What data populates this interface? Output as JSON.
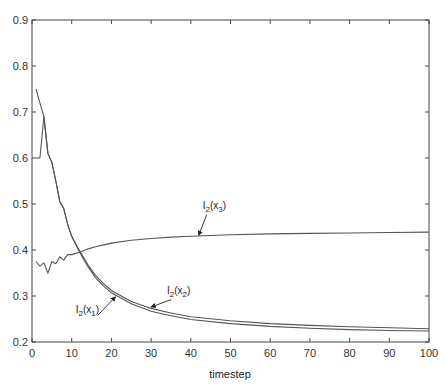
{
  "chart_data": {
    "type": "line",
    "title": "",
    "xlabel": "timestep",
    "ylabel": "",
    "xlim": [
      0,
      100
    ],
    "ylim": [
      0.2,
      0.9
    ],
    "xticks": [
      0,
      10,
      20,
      30,
      40,
      50,
      60,
      70,
      80,
      90,
      100
    ],
    "yticks": [
      0.2,
      0.3,
      0.4,
      0.5,
      0.6,
      0.7,
      0.8,
      0.9
    ],
    "ytick_labels": [
      "0.2",
      "0.3",
      "0.4",
      "0.5",
      "0.6",
      "0.7",
      "0.8",
      "0.9"
    ],
    "grid": false,
    "legend": "none",
    "line_color": "#555555",
    "series": [
      {
        "name": "I2(x1)",
        "label_base": "I",
        "label_sub1": "2",
        "label_mid": "(x",
        "label_sub2": "1",
        "label_end": ")",
        "x": [
          1,
          2,
          3,
          4,
          5,
          6,
          7,
          8,
          9,
          10,
          12,
          14,
          16,
          18,
          20,
          25,
          30,
          35,
          40,
          50,
          60,
          70,
          80,
          90,
          100
        ],
        "y": [
          0.75,
          0.72,
          0.69,
          0.61,
          0.59,
          0.55,
          0.505,
          0.49,
          0.455,
          0.43,
          0.395,
          0.365,
          0.34,
          0.322,
          0.307,
          0.283,
          0.267,
          0.257,
          0.249,
          0.24,
          0.234,
          0.23,
          0.227,
          0.225,
          0.224
        ]
      },
      {
        "name": "I2(x2)",
        "label_base": "I",
        "label_sub1": "2",
        "label_mid": "(x",
        "label_sub2": "2",
        "label_end": ")",
        "x": [
          1,
          2,
          3,
          4,
          5,
          6,
          7,
          8,
          9,
          10,
          12,
          14,
          16,
          18,
          20,
          25,
          30,
          35,
          40,
          50,
          60,
          70,
          80,
          90,
          100
        ],
        "y": [
          0.6,
          0.6,
          0.69,
          0.61,
          0.59,
          0.55,
          0.505,
          0.49,
          0.455,
          0.43,
          0.398,
          0.369,
          0.345,
          0.327,
          0.312,
          0.288,
          0.273,
          0.263,
          0.255,
          0.246,
          0.24,
          0.236,
          0.233,
          0.231,
          0.229
        ]
      },
      {
        "name": "I2(x3)",
        "label_base": "I",
        "label_sub1": "2",
        "label_mid": "(x",
        "label_sub2": "3",
        "label_end": ")",
        "x": [
          1,
          2,
          3,
          4,
          5,
          6,
          7,
          8,
          9,
          10,
          12,
          14,
          16,
          18,
          20,
          25,
          30,
          35,
          40,
          50,
          60,
          70,
          80,
          90,
          100
        ],
        "y": [
          0.375,
          0.365,
          0.372,
          0.35,
          0.375,
          0.37,
          0.385,
          0.378,
          0.39,
          0.39,
          0.395,
          0.402,
          0.407,
          0.411,
          0.415,
          0.421,
          0.425,
          0.428,
          0.43,
          0.433,
          0.435,
          0.436,
          0.437,
          0.438,
          0.439
        ]
      }
    ],
    "annotations": [
      {
        "series": "I2(x3)",
        "text_x": 43,
        "text_y": 0.49,
        "arrow_to_x": 42,
        "arrow_to_y": 0.432
      },
      {
        "series": "I2(x2)",
        "text_x": 34,
        "text_y": 0.305,
        "arrow_to_x": 30,
        "arrow_to_y": 0.276
      },
      {
        "series": "I2(x1)",
        "text_x": 11,
        "text_y": 0.262,
        "arrow_to_x": 21,
        "arrow_to_y": 0.298
      }
    ]
  }
}
